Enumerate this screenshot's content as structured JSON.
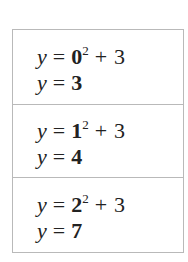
{
  "rows": [
    {
      "equation": {
        "variable": "y",
        "equals": "=",
        "base": "0",
        "exponent": "2",
        "plus": "+",
        "constant": "3"
      },
      "result": {
        "variable": "y",
        "equals": "=",
        "value": "3"
      }
    },
    {
      "equation": {
        "variable": "y",
        "equals": "=",
        "base": "1",
        "exponent": "2",
        "plus": "+",
        "constant": "3"
      },
      "result": {
        "variable": "y",
        "equals": "=",
        "value": "4"
      }
    },
    {
      "equation": {
        "variable": "y",
        "equals": "=",
        "base": "2",
        "exponent": "2",
        "plus": "+",
        "constant": "3"
      },
      "result": {
        "variable": "y",
        "equals": "=",
        "value": "7"
      }
    }
  ]
}
